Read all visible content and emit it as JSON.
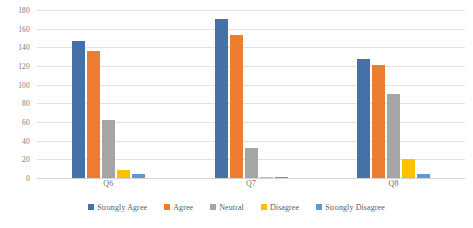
{
  "chart_data": {
    "type": "bar",
    "title": "",
    "subtitle": "",
    "xlabel": "",
    "ylabel": "",
    "categories": [
      "Q6",
      "Q7",
      "Q8"
    ],
    "series": [
      {
        "name": "Strongly Agree",
        "color": "#4472a8",
        "values": [
          147,
          170,
          127
        ]
      },
      {
        "name": "Agree",
        "color": "#ed7d31",
        "values": [
          136,
          153,
          121
        ]
      },
      {
        "name": "Neutral",
        "color": "#a5a5a5",
        "values": [
          62,
          32,
          90
        ]
      },
      {
        "name": "Disagree",
        "color": "#ffc000",
        "values": [
          9,
          1,
          20
        ]
      },
      {
        "name": "Strongly Disagree",
        "color": "#5b9bd5",
        "values": [
          4,
          1,
          4
        ]
      }
    ],
    "ylim": [
      0,
      180
    ],
    "ytick_step": 20,
    "yticks": [
      "0",
      "20",
      "40",
      "60",
      "80",
      "100",
      "120",
      "140",
      "160",
      "180"
    ],
    "grid": true,
    "legend_position": "bottom"
  }
}
